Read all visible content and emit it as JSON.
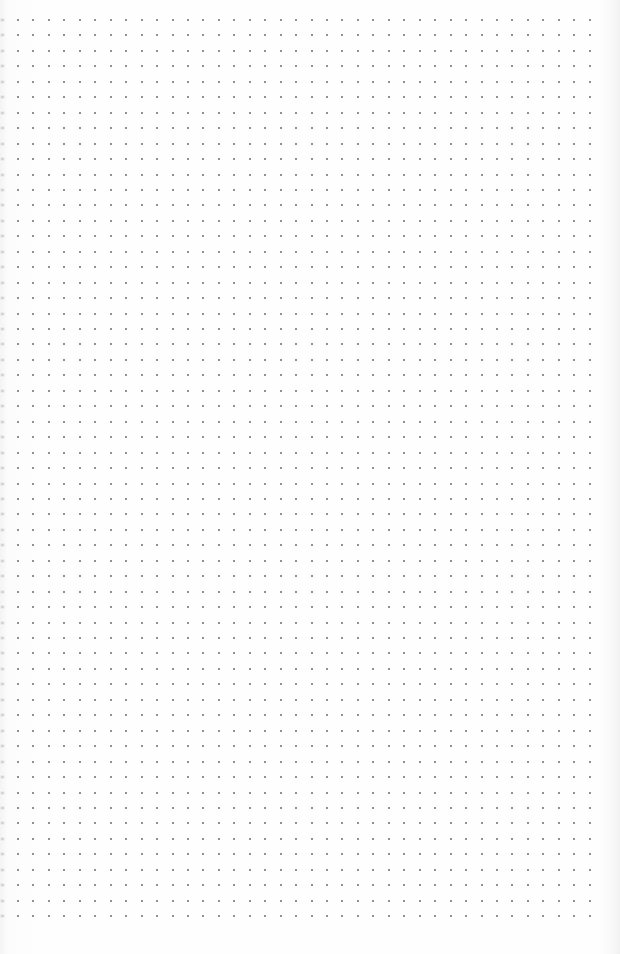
{
  "sheet": {
    "type": "dot-grid-paper",
    "background_color": "#fdfdfd",
    "dot_color": "#6b6b6b",
    "grid": {
      "columns": 38,
      "rows": 59,
      "origin_x": 18,
      "origin_y": 20,
      "spacing_x": 15.45,
      "spacing_y": 15.45,
      "dot_size": 2
    },
    "edge_marks": {
      "side": "left",
      "color": "#969696"
    }
  }
}
